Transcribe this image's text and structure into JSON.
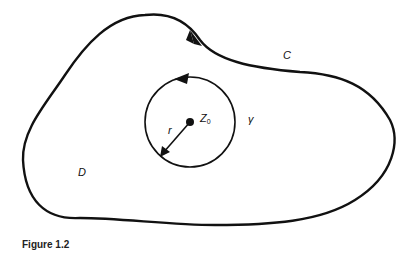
{
  "figure": {
    "caption": "Figure 1.2",
    "labels": {
      "curve": "C",
      "circle": "γ",
      "center": "Z",
      "center_sub": "0",
      "radius": "r",
      "domain": "D"
    }
  },
  "colors": {
    "stroke": "#111111",
    "background": "#ffffff"
  }
}
